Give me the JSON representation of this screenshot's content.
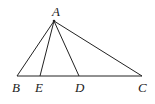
{
  "diagram": {
    "type": "triangle",
    "points": {
      "A": {
        "label": "A",
        "x": 54,
        "y": 21,
        "lx": 52,
        "ly": 16
      },
      "B": {
        "label": "B",
        "x": 17,
        "y": 76,
        "lx": 12,
        "ly": 92
      },
      "E": {
        "label": "E",
        "x": 40,
        "y": 76,
        "lx": 35,
        "ly": 92
      },
      "D": {
        "label": "D",
        "x": 79,
        "y": 76,
        "lx": 75,
        "ly": 92
      },
      "C": {
        "label": "C",
        "x": 142,
        "y": 76,
        "lx": 138,
        "ly": 92
      }
    },
    "segments": [
      "AB",
      "AE",
      "AD",
      "AC",
      "BC"
    ],
    "stroke_color": "#222222"
  }
}
